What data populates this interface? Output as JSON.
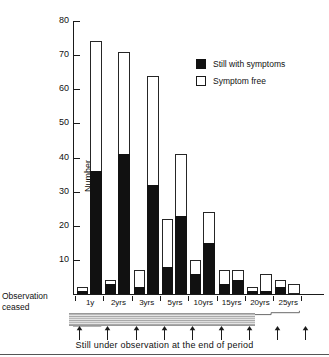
{
  "chart_data": {
    "type": "bar",
    "title": "",
    "subtitle": "",
    "xlabel": "Still under observation at the end of period",
    "ylabel": "Number",
    "ylim": [
      0,
      80
    ],
    "yticks": [
      0,
      10,
      20,
      30,
      40,
      50,
      60,
      70,
      80
    ],
    "ytick_labels": [
      "",
      "10",
      "20",
      "30",
      "40",
      "50",
      "60",
      "70",
      "80"
    ],
    "grid": false,
    "stacked": true,
    "legend_position": "upper right",
    "legend": [
      "Still with symptoms",
      "Symptom free"
    ],
    "categories": [
      "1y",
      "2yrs",
      "3yrs",
      "5yrs",
      "10yrs",
      "15yrs",
      "20yrs",
      "25yrs"
    ],
    "series": [
      {
        "name": "Still with symptoms",
        "values": [
          36,
          41,
          32,
          23,
          15,
          4,
          1,
          0
        ]
      },
      {
        "name": "Symptom free",
        "values": [
          38,
          30,
          32,
          18,
          9,
          3,
          5,
          3
        ]
      }
    ],
    "totals": [
      74,
      71,
      64,
      41,
      24,
      7,
      6,
      3
    ],
    "observation_ceased": {
      "label": "Observation ceased",
      "with_symptoms": [
        1,
        3,
        2,
        8,
        6,
        3,
        1,
        2
      ],
      "totals": [
        2,
        4,
        7,
        22,
        10,
        7,
        2,
        4
      ]
    },
    "annotations": {
      "observation_ceased_label_line1": "Observation",
      "observation_ceased_label_line2": "ceased",
      "bottom_caption": "Still under observation at the end of period"
    }
  },
  "axis": {
    "y_title": "Number",
    "y_labels": [
      "80",
      "70",
      "60",
      "50",
      "40",
      "30",
      "20",
      "10"
    ]
  },
  "legend": {
    "items": [
      {
        "label": "Still with symptoms",
        "swatch": "filled",
        "color": "#111111"
      },
      {
        "label": "Symptom free",
        "swatch": "hollow",
        "color": "#ffffff"
      }
    ]
  },
  "categories": [
    "1y",
    "2yrs",
    "3yrs",
    "5yrs",
    "10yrs",
    "15yrs",
    "20yrs",
    "25yrs"
  ],
  "labels": {
    "observation_ceased_l1": "Observation",
    "observation_ceased_l2": "ceased",
    "caption": "Still under observation at the end of period"
  },
  "colors": {
    "symptoms": "#111111",
    "free": "#ffffff",
    "axis": "#1a1a1a",
    "band": "#b9b9b9"
  }
}
